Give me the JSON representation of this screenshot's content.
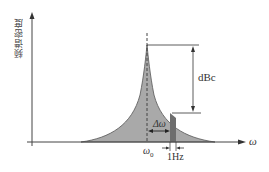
{
  "diagram": {
    "type": "phase-noise-spectrum",
    "y_axis_label": "频谱密度",
    "x_axis_label": "ω",
    "center_frequency_label": "ω",
    "center_frequency_subscript": "0",
    "offset_label": "Δω",
    "amplitude_label": "dBc",
    "bandwidth_label": "1Hz",
    "colors": {
      "fill": "#a9a9a9",
      "band": "#6e6e6e",
      "line": "#333333"
    }
  }
}
